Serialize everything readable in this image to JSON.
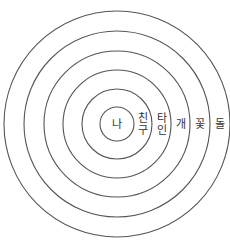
{
  "diagram": {
    "title": "",
    "type": "concentric-circles",
    "line_color": "#555555",
    "text_color": "#333333",
    "layers": [
      {
        "label": "나",
        "lines": [
          "나"
        ]
      },
      {
        "label": "친구",
        "lines": [
          "친",
          "구"
        ]
      },
      {
        "label": "타인",
        "lines": [
          "타",
          "인"
        ]
      },
      {
        "label": "개",
        "lines": [
          "개"
        ]
      },
      {
        "label": "꽃",
        "lines": [
          "꽃"
        ]
      },
      {
        "label": "돌",
        "lines": [
          "돌"
        ]
      }
    ]
  }
}
